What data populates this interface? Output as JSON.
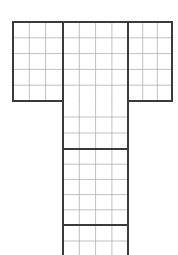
{
  "figure": {
    "name": "t-shaped-grid-diagram",
    "canvas": {
      "width": 178,
      "height": 255
    },
    "background_color": "#ffffff"
  },
  "style": {
    "thick_line_color": "#3a3a3a",
    "thin_line_color": "#b9b9b9",
    "thick_line_width": 1.9,
    "thin_line_width": 0.9
  },
  "geometry": {
    "cell_width": 16.3,
    "cell_height": 15.8,
    "top_bar": {
      "x_left": 13,
      "x_right": 172,
      "y_top": 22,
      "y_bottom": 101,
      "rows": 5,
      "columns": 10,
      "section_divider_x": [
        63,
        128
      ],
      "column_x": [
        13,
        29.3,
        45.6,
        63,
        79.3,
        95.6,
        111.9,
        128,
        142.7,
        157.3,
        172
      ],
      "row_y": [
        22,
        37.8,
        53.6,
        69.4,
        85.2,
        101
      ]
    },
    "stem": {
      "x_left": 63,
      "x_right": 128,
      "y_top": 101,
      "y_bottom": 255,
      "columns": 4,
      "column_x": [
        63,
        79.3,
        95.6,
        111.9,
        128
      ],
      "row_y": [
        101,
        117,
        133,
        149,
        164.2,
        179.4,
        194.6,
        209.8,
        225,
        241,
        255
      ],
      "thick_row_y": [
        149,
        225
      ],
      "clipped_at_bottom": true
    }
  },
  "labels": {
    "top_bar_left_section": "",
    "top_bar_middle_section": "",
    "top_bar_right_section": "",
    "stem_upper_block": "",
    "stem_middle_block": "",
    "stem_lower_block": ""
  }
}
